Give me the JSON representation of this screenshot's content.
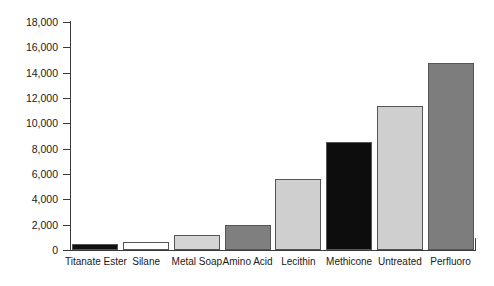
{
  "chart_data": {
    "type": "bar",
    "title": "",
    "subtitle": "",
    "xlabel": "",
    "ylabel": "",
    "grid": false,
    "legend": "none",
    "ylim": [
      0,
      18000
    ],
    "ytick_step": 2000,
    "ytick_labels": [
      "18,000",
      "16,000",
      "14,000",
      "12,000",
      "10,000",
      "8,000",
      "6,000",
      "4,000",
      "2,000",
      "0"
    ],
    "ytick_values": [
      18000,
      16000,
      14000,
      12000,
      10000,
      8000,
      6000,
      4000,
      2000,
      0
    ],
    "categories": [
      "Titanate Ester",
      "Silane",
      "Metal Soap",
      "Amino Acid",
      "Lecithin",
      "Methicone",
      "Untreated",
      "Perfluoro"
    ],
    "values": [
      500,
      600,
      1200,
      2000,
      5600,
      8500,
      11400,
      14800
    ],
    "bar_colors": [
      "#111111",
      "#ffffff",
      "#d4d4d4",
      "#7f7f7f",
      "#cfcfcf",
      "#0d0d0d",
      "#cfcfcf",
      "#7d7d7d"
    ],
    "bar_edge_color": "#555555",
    "axis_color": "#3a3a3a",
    "text_color": "#1a1a1a",
    "background": "#ffffff"
  }
}
